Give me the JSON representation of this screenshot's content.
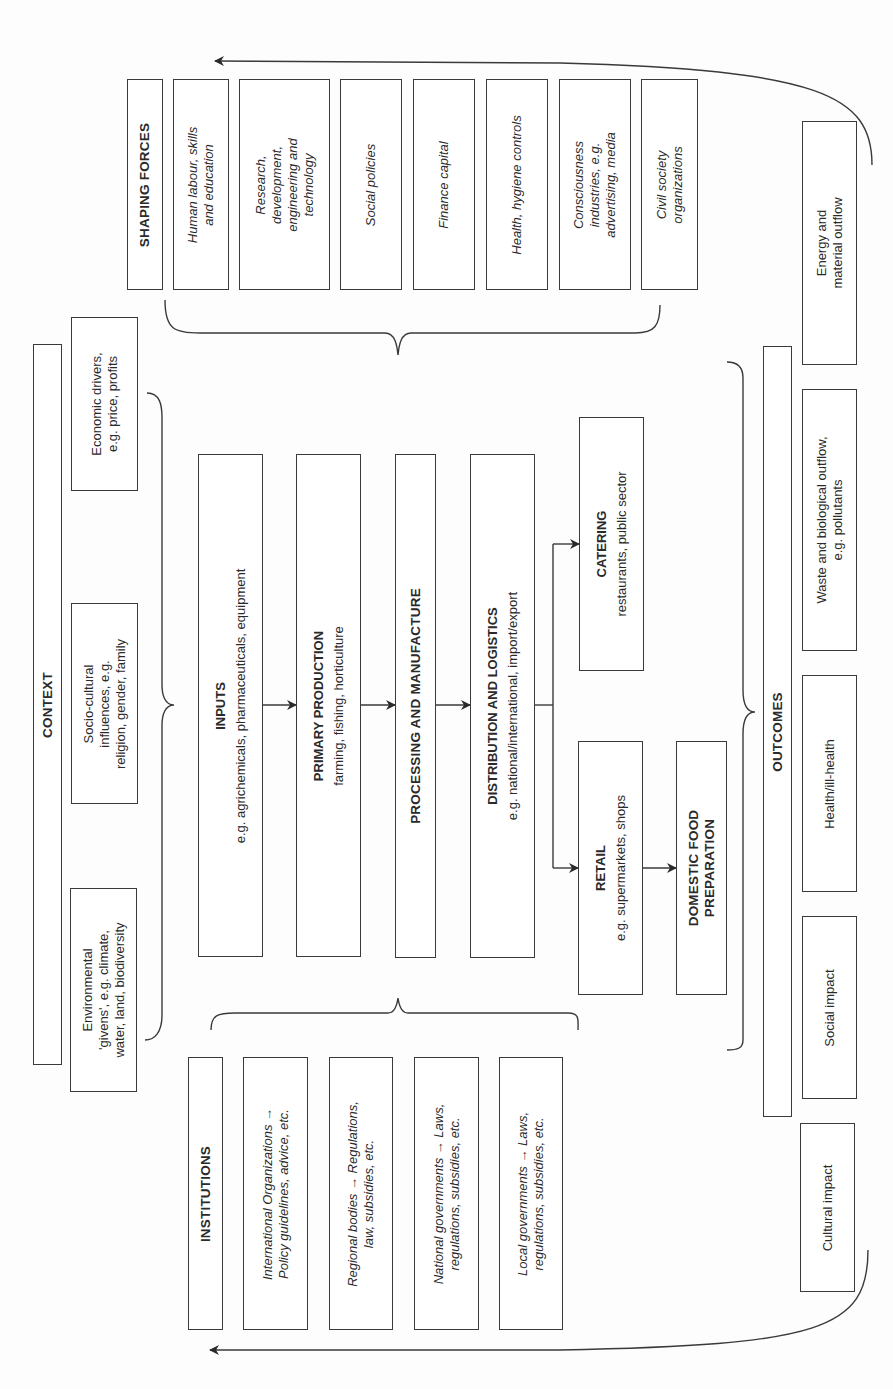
{
  "shaping_forces": {
    "title": "SHAPING FORCES",
    "items": [
      {
        "lines": [
          "Human labour, skills",
          "and education"
        ]
      },
      {
        "lines": [
          "Research,",
          "development,",
          "engineering and",
          "technology"
        ]
      },
      {
        "lines": [
          "Social policies"
        ]
      },
      {
        "lines": [
          "Finance capital"
        ]
      },
      {
        "lines": [
          "Health, hygiene controls"
        ]
      },
      {
        "lines": [
          "Consciousness",
          "industries, e.g.",
          "advertising, media"
        ]
      },
      {
        "lines": [
          "Civil society",
          "organizations"
        ]
      }
    ]
  },
  "context": {
    "title": "CONTEXT",
    "items": [
      {
        "lines": [
          "Economic drivers,",
          "e.g. price, profits"
        ]
      },
      {
        "lines": [
          "Socio-cultural",
          "influences, e.g.",
          "religion, gender, family"
        ]
      },
      {
        "lines": [
          "Environmental",
          "'givens', e.g. climate,",
          "water, land, biodiversity"
        ]
      }
    ]
  },
  "chain": {
    "inputs": {
      "title": "INPUTS",
      "desc": "e.g. agrichemicals, pharmaceuticals, equipment"
    },
    "primary": {
      "title": "PRIMARY PRODUCTION",
      "desc": "farming, fishing, horticulture"
    },
    "processing": {
      "title": "PROCESSING AND MANUFACTURE"
    },
    "distribution": {
      "title": "DISTRIBUTION AND LOGISTICS",
      "desc": "e.g. national/international, import/export"
    },
    "catering": {
      "title": "CATERING",
      "desc": "restaurants, public sector"
    },
    "retail": {
      "title": "RETAIL",
      "desc": "e.g. supermarkets, shops"
    },
    "domestic": {
      "lines": [
        "DOMESTIC FOOD",
        "PREPARATION"
      ]
    }
  },
  "institutions": {
    "title": "INSTITUTIONS",
    "items": [
      {
        "lines": [
          "International Organizations →",
          "Policy guidelines, advice, etc."
        ]
      },
      {
        "lines": [
          "Regional bodies → Regulations,",
          "law, subsidies, etc."
        ]
      },
      {
        "lines": [
          "National governments → Laws,",
          "regulations, subsidies, etc."
        ]
      },
      {
        "lines": [
          "Local governments → Laws,",
          "regulations, subsidies, etc."
        ]
      }
    ]
  },
  "outcomes": {
    "title": "OUTCOMES",
    "items": [
      {
        "lines": [
          "Energy and",
          "material outflow"
        ]
      },
      {
        "lines": [
          "Waste and biological outflow,",
          "e.g. pollutants"
        ]
      },
      {
        "lines": [
          "Health/ill-health"
        ]
      },
      {
        "lines": [
          "Social impact"
        ]
      },
      {
        "lines": [
          "Cultural impact"
        ]
      }
    ]
  },
  "colors": {
    "stroke": "#3a3a3a",
    "text": "#2a2a2a",
    "background": "#fdfdfd"
  }
}
